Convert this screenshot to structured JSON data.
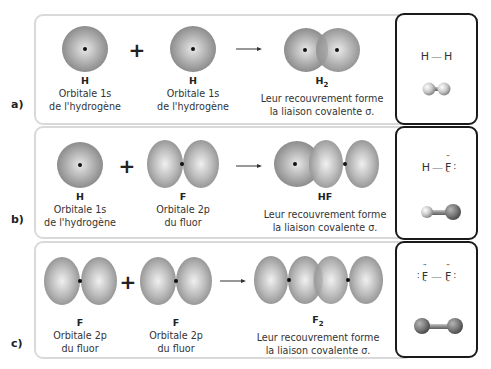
{
  "rows": [
    {
      "label": "a)",
      "reactant1": {
        "symbol": "H",
        "line1": "Orbitale 1s",
        "line2": "de l'hydrogène",
        "orbital": "1s"
      },
      "operator": "+",
      "reactant2": {
        "symbol": "H",
        "line1": "Orbitale 1s",
        "line2": "de l'hydrogène",
        "orbital": "1s"
      },
      "product": {
        "symbol": "H",
        "subscript": "2",
        "line1": "Leur recouvrement forme",
        "line2": "la liaison covalente σ."
      },
      "lewis": {
        "left": "H",
        "bond": "—",
        "right": "H"
      },
      "model": "H2 ball-and-stick"
    },
    {
      "label": "b)",
      "reactant1": {
        "symbol": "H",
        "line1": "Orbitale 1s",
        "line2": "de l'hydrogène",
        "orbital": "1s"
      },
      "operator": "+",
      "reactant2": {
        "symbol": "F",
        "line1": "Orbitale 2p",
        "line2": "du fluor",
        "orbital": "2p"
      },
      "product": {
        "symbol": "HF",
        "subscript": "",
        "line1": "Leur recouvrement forme",
        "line2": "la liaison covalente σ."
      },
      "lewis": {
        "left": "H",
        "bond": "—",
        "right": "F"
      },
      "model": "HF ball-and-stick"
    },
    {
      "label": "c)",
      "reactant1": {
        "symbol": "F",
        "line1": "Orbitale 2p",
        "line2": "du fluor",
        "orbital": "2p"
      },
      "operator": "+",
      "reactant2": {
        "symbol": "F",
        "line1": "Orbitale 2p",
        "line2": "du fluor",
        "orbital": "2p"
      },
      "product": {
        "symbol": "F",
        "subscript": "2",
        "line1": "Leur recouvrement forme",
        "line2": "la liaison covalente σ."
      },
      "lewis": {
        "left": "F",
        "bond": "—",
        "right": "F"
      },
      "model": "F2 ball-and-stick"
    }
  ],
  "colors": {
    "orbital_light": "#e6e6e6",
    "orbital_dark": "#8a8a8a",
    "panel_border": "#d9d9d9",
    "box_border": "#1a1a1a"
  }
}
